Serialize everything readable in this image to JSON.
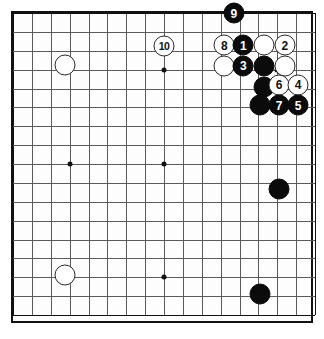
{
  "diagram": {
    "type": "go-board-diagram",
    "board": {
      "columns": 17,
      "rows": 17,
      "grid_spacing_px": 18.875,
      "origin_x_px": 11,
      "origin_y_px": 11,
      "line_color": "#5a5a5a",
      "edge_color": "#111111",
      "background_color": "#fdfdfd"
    },
    "star_points": [
      {
        "name": "star-point-upper-left",
        "col": 3,
        "row": 3
      },
      {
        "name": "star-point-upper-right",
        "col": 8,
        "row": 3
      },
      {
        "name": "star-point-left",
        "col": 3,
        "row": 8
      },
      {
        "name": "star-point-center",
        "col": 8,
        "row": 8
      },
      {
        "name": "star-point-lower-left",
        "col": 3,
        "row": 14
      },
      {
        "name": "star-point-lower-center",
        "col": 8,
        "row": 14
      },
      {
        "name": "star-point-upper-right-2",
        "col": 14,
        "row": 3
      }
    ],
    "stones": [
      {
        "id": "stone-9",
        "color": "black",
        "label": "9",
        "col": 11.7,
        "row": 0.0
      },
      {
        "id": "stone-8",
        "color": "white",
        "label": "8",
        "col": 11.2,
        "row": 1.7
      },
      {
        "id": "stone-1",
        "color": "black",
        "label": "1",
        "col": 12.2,
        "row": 1.7
      },
      {
        "id": "stone-w-a",
        "color": "white",
        "label": "",
        "col": 13.3,
        "row": 1.7
      },
      {
        "id": "stone-2",
        "color": "white",
        "label": "2",
        "col": 14.4,
        "row": 1.7
      },
      {
        "id": "stone-w-b",
        "color": "white",
        "label": "",
        "col": 11.2,
        "row": 2.8
      },
      {
        "id": "stone-3",
        "color": "black",
        "label": "3",
        "col": 12.2,
        "row": 2.8
      },
      {
        "id": "stone-b-a",
        "color": "black",
        "label": "",
        "col": 13.3,
        "row": 2.8
      },
      {
        "id": "stone-w-c",
        "color": "white",
        "label": "",
        "col": 14.4,
        "row": 2.8
      },
      {
        "id": "stone-b-b",
        "color": "black",
        "label": "",
        "col": 13.3,
        "row": 3.9
      },
      {
        "id": "stone-6",
        "color": "white",
        "label": "6",
        "col": 14.1,
        "row": 3.8
      },
      {
        "id": "stone-4",
        "color": "white",
        "label": "4",
        "col": 15.1,
        "row": 3.8
      },
      {
        "id": "stone-b-c",
        "color": "black",
        "label": "",
        "col": 13.1,
        "row": 4.9
      },
      {
        "id": "stone-7",
        "color": "black",
        "label": "7",
        "col": 14.1,
        "row": 4.9
      },
      {
        "id": "stone-5",
        "color": "black",
        "label": "5",
        "col": 15.1,
        "row": 4.9
      },
      {
        "id": "stone-10",
        "color": "white",
        "label": "10",
        "col": 8.0,
        "row": 1.75
      },
      {
        "id": "stone-w-d",
        "color": "white",
        "label": "",
        "col": 2.75,
        "row": 2.75
      },
      {
        "id": "stone-w-e",
        "color": "white",
        "label": "",
        "col": 2.75,
        "row": 13.9
      },
      {
        "id": "stone-b-d",
        "color": "black",
        "label": "",
        "col": 14.1,
        "row": 9.3
      },
      {
        "id": "stone-b-e",
        "color": "black",
        "label": "",
        "col": 13.1,
        "row": 14.9
      }
    ]
  }
}
